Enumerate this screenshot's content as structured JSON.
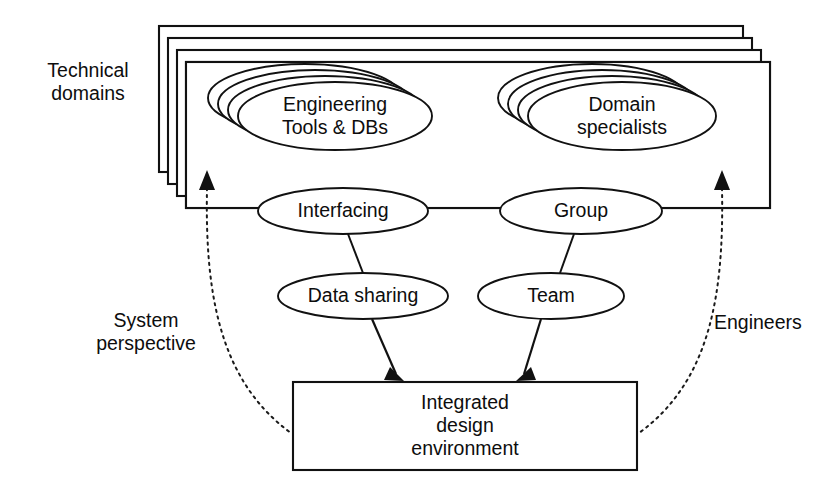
{
  "diagram": {
    "title": "Integrated design environment",
    "type": "block-and-ellipse concept diagram",
    "background_color": "#ffffff",
    "line_color": "#111111",
    "text_color": "#0d0d0d"
  },
  "labels": {
    "technical_domains_line1": "Technical",
    "technical_domains_line2": "domains",
    "system_perspective_line1": "System",
    "system_perspective_line2": "perspective",
    "engineers": "Engineers"
  },
  "stack": {
    "count": 4,
    "front_box": {
      "left_group_line1": "Engineering",
      "left_group_line2": "Tools & DBs",
      "right_group_line1": "Domain",
      "right_group_line2": "specialists"
    },
    "ellipse_stack_count": 4
  },
  "nodes": {
    "interfacing": "Interfacing",
    "data_sharing": "Data sharing",
    "group": "Group",
    "team": "Team"
  },
  "target_box": {
    "line1": "Integrated",
    "line2": "design",
    "line3": "environment"
  }
}
